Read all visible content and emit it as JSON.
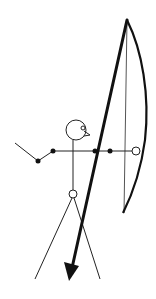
{
  "figure": {
    "colors": {
      "line": "#111111",
      "background": "#ffffff"
    }
  },
  "elements": {
    "head": {
      "cx": 76,
      "cy": 130,
      "r": 10
    },
    "eye": {
      "cx": 83,
      "cy": 128,
      "r": 2
    },
    "hip_joint": {
      "cx": 73,
      "cy": 194,
      "r": 4
    },
    "bow_hand_joint": {
      "cx": 136,
      "cy": 151,
      "r": 4
    },
    "arm_joints": [
      {
        "cx": 38,
        "cy": 161
      },
      {
        "cx": 53,
        "cy": 151
      },
      {
        "cx": 95,
        "cy": 151
      },
      {
        "cx": 110,
        "cy": 151
      }
    ]
  }
}
